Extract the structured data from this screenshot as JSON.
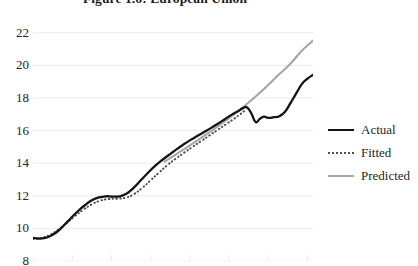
{
  "title": "Figure 1.6: European Union",
  "chart_data": {
    "type": "line",
    "title": "Figure 1.6: European Union",
    "xlabel": "",
    "ylabel": "",
    "ylim": [
      8,
      22.6
    ],
    "yticks": [
      8,
      10,
      12,
      14,
      16,
      18,
      20,
      22
    ],
    "ytick_labels": [
      "8",
      "10",
      "12",
      "14",
      "16",
      "18",
      "20",
      "22"
    ],
    "xlim": [
      0,
      100
    ],
    "grid": "horizontal",
    "legend_position": "right",
    "colors": {
      "actual": "#141414",
      "fitted": "#4d4d4d",
      "predicted": "#a6a6a6",
      "gridline": "#ebebeb",
      "text": "#262626"
    },
    "series": [
      {
        "name": "Actual",
        "style": "solid",
        "color": "#141414",
        "points": [
          [
            0.0,
            9.42
          ],
          [
            2.0,
            9.38
          ],
          [
            4.0,
            9.4
          ],
          [
            6.0,
            9.52
          ],
          [
            8.5,
            9.78
          ],
          [
            11.0,
            10.18
          ],
          [
            13.5,
            10.62
          ],
          [
            16.0,
            11.05
          ],
          [
            18.5,
            11.42
          ],
          [
            21.0,
            11.72
          ],
          [
            23.5,
            11.9
          ],
          [
            26.0,
            11.97
          ],
          [
            28.5,
            11.95
          ],
          [
            31.0,
            11.97
          ],
          [
            33.5,
            12.14
          ],
          [
            36.0,
            12.5
          ],
          [
            38.5,
            12.95
          ],
          [
            41.0,
            13.4
          ],
          [
            43.5,
            13.82
          ],
          [
            46.0,
            14.18
          ],
          [
            48.5,
            14.5
          ],
          [
            51.0,
            14.82
          ],
          [
            53.5,
            15.12
          ],
          [
            56.0,
            15.4
          ],
          [
            58.5,
            15.65
          ],
          [
            61.0,
            15.9
          ],
          [
            63.5,
            16.15
          ],
          [
            66.0,
            16.42
          ],
          [
            68.5,
            16.7
          ],
          [
            71.0,
            16.98
          ],
          [
            73.5,
            17.22
          ],
          [
            75.0,
            17.38
          ],
          [
            76.5,
            17.42
          ],
          [
            78.0,
            17.05
          ],
          [
            79.5,
            16.52
          ],
          [
            81.0,
            16.72
          ],
          [
            82.5,
            16.85
          ],
          [
            84.0,
            16.78
          ],
          [
            86.0,
            16.82
          ],
          [
            88.0,
            16.88
          ],
          [
            90.0,
            17.15
          ],
          [
            92.0,
            17.7
          ],
          [
            94.0,
            18.28
          ],
          [
            96.0,
            18.85
          ],
          [
            98.0,
            19.18
          ],
          [
            100.0,
            19.42
          ]
        ]
      },
      {
        "name": "Fitted",
        "style": "dotted",
        "color": "#4d4d4d",
        "points": [
          [
            0.0,
            9.35
          ],
          [
            3.0,
            9.42
          ],
          [
            6.0,
            9.6
          ],
          [
            9.0,
            9.92
          ],
          [
            12.0,
            10.32
          ],
          [
            15.0,
            10.75
          ],
          [
            18.0,
            11.15
          ],
          [
            21.0,
            11.48
          ],
          [
            24.0,
            11.7
          ],
          [
            27.0,
            11.8
          ],
          [
            30.0,
            11.82
          ],
          [
            33.0,
            11.88
          ],
          [
            36.0,
            12.1
          ],
          [
            39.0,
            12.48
          ],
          [
            42.0,
            12.95
          ],
          [
            45.0,
            13.42
          ],
          [
            48.0,
            13.88
          ],
          [
            51.0,
            14.28
          ],
          [
            54.0,
            14.65
          ],
          [
            57.0,
            15.0
          ],
          [
            60.0,
            15.35
          ],
          [
            63.0,
            15.7
          ],
          [
            66.0,
            16.05
          ],
          [
            69.0,
            16.4
          ],
          [
            72.0,
            16.75
          ],
          [
            74.0,
            17.0
          ],
          [
            76.0,
            17.28
          ]
        ]
      },
      {
        "name": "Predicted",
        "style": "solid",
        "color": "#a6a6a6",
        "points": [
          [
            47.0,
            14.1
          ],
          [
            52.0,
            14.65
          ],
          [
            57.0,
            15.2
          ],
          [
            62.0,
            15.78
          ],
          [
            67.0,
            16.38
          ],
          [
            72.0,
            17.02
          ],
          [
            77.0,
            17.72
          ],
          [
            82.0,
            18.48
          ],
          [
            87.0,
            19.3
          ],
          [
            92.0,
            20.12
          ],
          [
            96.0,
            20.9
          ],
          [
            100.0,
            21.52
          ]
        ]
      }
    ]
  },
  "legend": {
    "items": [
      {
        "label": "Actual",
        "key": "solid-dark"
      },
      {
        "label": "Fitted",
        "key": "dotted"
      },
      {
        "label": "Predicted",
        "key": "solid-gray"
      }
    ]
  }
}
